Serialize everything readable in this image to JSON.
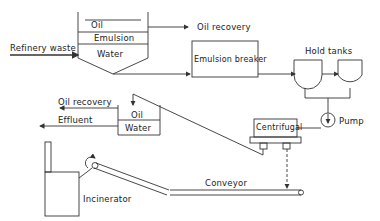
{
  "diagram": {
    "type": "process flow",
    "labels": {
      "refinery_waste": "Refinery waste",
      "tank_oil": "Oil",
      "tank_emulsion": "Emulsion",
      "tank_water": "Water",
      "oil_recovery_top": "Oil recovery",
      "emulsion_breaker": "Emulsion breaker",
      "hold_tanks": "Hold tanks",
      "pump": "Pump",
      "centrifugal": "Centrifugal",
      "oil_recovery_bottom": "Oil recovery",
      "effluent": "Effluent",
      "sep_oil": "Oil",
      "sep_water": "Water",
      "conveyor": "Conveyor",
      "incinerator": "Incinerator"
    },
    "line_color": "#333333",
    "background": "#ffffff"
  }
}
